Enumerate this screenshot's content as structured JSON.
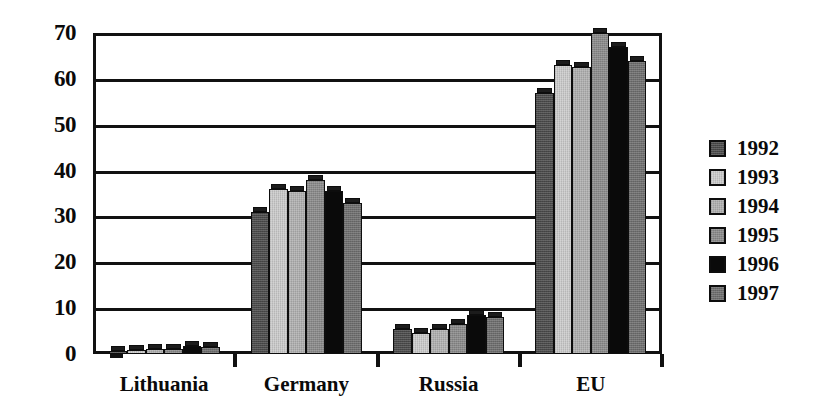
{
  "chart_data": {
    "type": "bar",
    "title": "",
    "subtitle": "",
    "xlabel": "",
    "ylabel": "",
    "categories": [
      "Lithuania",
      "Germany",
      "Russia",
      "EU"
    ],
    "series": [
      {
        "name": "1992",
        "color": "#4a4a4a",
        "values": [
          0.7,
          31.0,
          5.5,
          57.0
        ]
      },
      {
        "name": "1993",
        "color": "#cbcbcb",
        "values": [
          0.8,
          36.0,
          4.5,
          63.0
        ]
      },
      {
        "name": "1994",
        "color": "#b0b0b0",
        "values": [
          1.0,
          35.5,
          5.5,
          62.5
        ]
      },
      {
        "name": "1995",
        "color": "#8a8a8a",
        "values": [
          1.2,
          38.0,
          6.5,
          70.0
        ]
      },
      {
        "name": "1996",
        "color": "#0a0a0a",
        "values": [
          1.8,
          35.5,
          8.5,
          67.0
        ]
      },
      {
        "name": "1997",
        "color": "#6e6e6e",
        "values": [
          1.5,
          33.0,
          8.0,
          64.0
        ]
      }
    ],
    "ylim": [
      0,
      70
    ],
    "ytick_values": [
      0,
      10,
      20,
      30,
      40,
      50,
      60,
      70
    ],
    "ytick_labels": [
      "0",
      "10",
      "20",
      "30",
      "40",
      "50",
      "60",
      "70"
    ],
    "grid": true,
    "grid_axis": "y",
    "legend_position": "right",
    "legend_entries": [
      "1992",
      "1993",
      "1994",
      "1995",
      "1996",
      "1997"
    ],
    "annotations": []
  },
  "colors": {
    "axis": "#111111",
    "text": "#0a0a0a",
    "background": "#ffffff",
    "bar_outline": "#0d0d0d"
  }
}
